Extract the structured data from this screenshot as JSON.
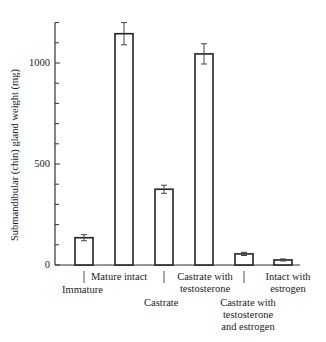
{
  "chart_data": {
    "type": "bar",
    "title": "",
    "xlabel": "",
    "ylabel": "Submandibular (chin) gland weight (mg)",
    "ylim": [
      0,
      1200
    ],
    "yticks": [
      0,
      500,
      1000
    ],
    "minor_tick_step": 100,
    "grid": false,
    "legend": null,
    "categories": [
      "Immature",
      "Mature intact",
      "Castrate",
      "Castrate with testosterone",
      "Castrate with testosterone and estrogen",
      "Intact with estrogen"
    ],
    "values": [
      135,
      1145,
      375,
      1045,
      55,
      25
    ],
    "errors": [
      15,
      55,
      20,
      50,
      8,
      5
    ]
  },
  "labels": {
    "ylabel": "Submandibular (chin) gland weight (mg)",
    "tick_0": "0",
    "tick_500": "500",
    "tick_1000": "1000",
    "cat_0": "Immature",
    "cat_1": "Mature intact",
    "cat_2": "Castrate",
    "cat_3a": "Castrate with",
    "cat_3b": "testosterone",
    "cat_4a": "Castrate with",
    "cat_4b": "testosterone",
    "cat_4c": "and estrogen",
    "cat_5a": "Intact with",
    "cat_5b": "estrogen"
  }
}
